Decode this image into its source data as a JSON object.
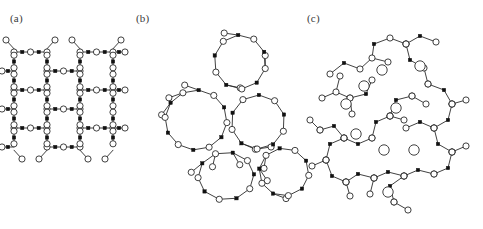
{
  "figure": {
    "background_color": "#ffffff",
    "stroke_color": "#2b2b2b",
    "node_fill_color": "#ffffff",
    "cation_fill_color": "#111111",
    "width": 483,
    "height": 229
  },
  "legend_geometry": {
    "oxygen_radius": 3.1,
    "cation_half_size": 1.7,
    "modifier_radius": 5.2,
    "bond_width": 0.9
  },
  "panels": [
    {
      "id": "a",
      "label": "(a)",
      "label_x": 10,
      "label_y": 22,
      "description": "crystalline network",
      "origin_x": 14,
      "origin_y": 52,
      "cell_w": 33,
      "cell_h": 38,
      "cols": 3,
      "rows": 5
    },
    {
      "id": "b",
      "label": "(b)",
      "label_x": 136,
      "label_y": 22,
      "description": "amorphous network",
      "origin_x": 150,
      "origin_y": 26
    },
    {
      "id": "c",
      "label": "(c)",
      "label_x": 307,
      "label_y": 22,
      "description": "modified amorphous network with modifier cations",
      "origin_x": 318,
      "origin_y": 26
    }
  ],
  "panel_b_rings": [
    {
      "cx": 240,
      "cy": 62,
      "rx": 26,
      "ry": 27,
      "n": 10,
      "rot": 14
    },
    {
      "cx": 196,
      "cy": 120,
      "rx": 31,
      "ry": 30,
      "n": 12,
      "rot": 5
    },
    {
      "cx": 258,
      "cy": 122,
      "rx": 27,
      "ry": 27,
      "n": 10,
      "rot": 20
    },
    {
      "cx": 226,
      "cy": 176,
      "rx": 28,
      "ry": 24,
      "n": 10,
      "rot": 32
    },
    {
      "cx": 284,
      "cy": 172,
      "rx": 25,
      "ry": 24,
      "n": 10,
      "rot": 8
    }
  ],
  "panel_b_terminals": [
    {
      "from_ring": 0,
      "from_idx": 0,
      "dx": 0,
      "dy": -13
    },
    {
      "from_ring": 0,
      "from_idx": 7,
      "dx": -14,
      "dy": -2
    },
    {
      "from_ring": 0,
      "from_idx": 3,
      "dx": 14,
      "dy": 3
    },
    {
      "from_ring": 1,
      "from_idx": 9,
      "dx": -14,
      "dy": -5
    },
    {
      "from_ring": 1,
      "from_idx": 8,
      "dx": -14,
      "dy": 5
    },
    {
      "from_ring": 1,
      "from_idx": 7,
      "dx": -9,
      "dy": 12
    },
    {
      "from_ring": 2,
      "from_idx": 2,
      "dx": 14,
      "dy": -2
    },
    {
      "from_ring": 2,
      "from_idx": 3,
      "dx": 14,
      "dy": 6
    },
    {
      "from_ring": 3,
      "from_idx": 5,
      "dx": -11,
      "dy": 9
    },
    {
      "from_ring": 3,
      "from_idx": 6,
      "dx": -3,
      "dy": 13
    },
    {
      "from_ring": 3,
      "from_idx": 7,
      "dx": 7,
      "dy": 12
    },
    {
      "from_ring": 4,
      "from_idx": 3,
      "dx": 13,
      "dy": 5
    },
    {
      "from_ring": 4,
      "from_idx": 5,
      "dx": 8,
      "dy": 12
    },
    {
      "from_ring": 4,
      "from_idx": 6,
      "dx": -2,
      "dy": 13
    }
  ],
  "panel_c_chains": [
    {
      "pts": [
        [
          330,
          74
        ],
        [
          344,
          63
        ],
        [
          360,
          69
        ],
        [
          372,
          58
        ],
        [
          388,
          62
        ]
      ]
    },
    {
      "pts": [
        [
          322,
          98
        ],
        [
          336,
          92
        ],
        [
          350,
          98
        ],
        [
          352,
          114
        ]
      ]
    },
    {
      "pts": [
        [
          336,
          92
        ],
        [
          340,
          76
        ]
      ]
    },
    {
      "pts": [
        [
          350,
          98
        ],
        [
          366,
          94
        ],
        [
          372,
          80
        ]
      ]
    },
    {
      "pts": [
        [
          372,
          58
        ],
        [
          374,
          44
        ],
        [
          390,
          38
        ],
        [
          406,
          44
        ]
      ]
    },
    {
      "pts": [
        [
          406,
          44
        ],
        [
          420,
          36
        ],
        [
          436,
          42
        ]
      ]
    },
    {
      "pts": [
        [
          406,
          44
        ],
        [
          410,
          60
        ],
        [
          424,
          68
        ],
        [
          428,
          84
        ]
      ]
    },
    {
      "pts": [
        [
          428,
          84
        ],
        [
          444,
          90
        ],
        [
          452,
          104
        ]
      ]
    },
    {
      "pts": [
        [
          452,
          104
        ],
        [
          466,
          100
        ]
      ]
    },
    {
      "pts": [
        [
          452,
          104
        ],
        [
          448,
          120
        ],
        [
          434,
          128
        ]
      ]
    },
    {
      "pts": [
        [
          434,
          128
        ],
        [
          420,
          122
        ],
        [
          406,
          128
        ]
      ]
    },
    {
      "pts": [
        [
          434,
          128
        ],
        [
          438,
          144
        ],
        [
          452,
          152
        ]
      ]
    },
    {
      "pts": [
        [
          452,
          152
        ],
        [
          466,
          146
        ]
      ]
    },
    {
      "pts": [
        [
          452,
          152
        ],
        [
          448,
          168
        ],
        [
          434,
          174
        ]
      ]
    },
    {
      "pts": [
        [
          434,
          174
        ],
        [
          418,
          170
        ],
        [
          404,
          176
        ]
      ]
    },
    {
      "pts": [
        [
          404,
          176
        ],
        [
          390,
          186
        ],
        [
          394,
          202
        ]
      ]
    },
    {
      "pts": [
        [
          394,
          202
        ],
        [
          408,
          210
        ]
      ]
    },
    {
      "pts": [
        [
          404,
          176
        ],
        [
          388,
          172
        ],
        [
          374,
          178
        ]
      ]
    },
    {
      "pts": [
        [
          374,
          178
        ],
        [
          358,
          174
        ],
        [
          346,
          182
        ]
      ]
    },
    {
      "pts": [
        [
          346,
          182
        ],
        [
          332,
          176
        ],
        [
          326,
          160
        ]
      ]
    },
    {
      "pts": [
        [
          326,
          160
        ],
        [
          330,
          144
        ],
        [
          344,
          138
        ]
      ]
    },
    {
      "pts": [
        [
          344,
          138
        ],
        [
          358,
          144
        ],
        [
          372,
          138
        ]
      ]
    },
    {
      "pts": [
        [
          344,
          138
        ],
        [
          334,
          126
        ],
        [
          320,
          130
        ]
      ]
    },
    {
      "pts": [
        [
          372,
          138
        ],
        [
          376,
          122
        ],
        [
          390,
          116
        ]
      ]
    },
    {
      "pts": [
        [
          390,
          116
        ],
        [
          396,
          100
        ],
        [
          412,
          96
        ]
      ]
    },
    {
      "pts": [
        [
          326,
          160
        ],
        [
          312,
          166
        ]
      ]
    },
    {
      "pts": [
        [
          346,
          182
        ],
        [
          350,
          196
        ]
      ]
    },
    {
      "pts": [
        [
          374,
          178
        ],
        [
          370,
          194
        ]
      ]
    },
    {
      "pts": [
        [
          320,
          130
        ],
        [
          310,
          120
        ]
      ]
    },
    {
      "pts": [
        [
          412,
          96
        ],
        [
          426,
          104
        ]
      ]
    },
    {
      "pts": [
        [
          390,
          116
        ],
        [
          404,
          120
        ]
      ]
    }
  ],
  "panel_c_modifiers": [
    {
      "cx": 382,
      "cy": 70
    },
    {
      "cx": 364,
      "cy": 86
    },
    {
      "cx": 346,
      "cy": 104
    },
    {
      "cx": 396,
      "cy": 108
    },
    {
      "cx": 356,
      "cy": 134
    },
    {
      "cx": 384,
      "cy": 150
    },
    {
      "cx": 414,
      "cy": 150
    },
    {
      "cx": 388,
      "cy": 192
    },
    {
      "cx": 420,
      "cy": 66
    }
  ]
}
